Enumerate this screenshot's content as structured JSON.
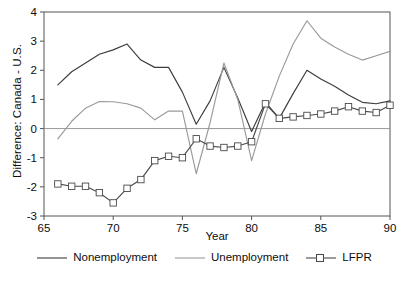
{
  "chart_data": {
    "type": "line",
    "title": "",
    "xlabel": "Year",
    "ylabel": "Difference: Canada - U.S.",
    "xlim": [
      65,
      90
    ],
    "ylim": [
      -3,
      4
    ],
    "xticks": [
      65,
      70,
      75,
      80,
      85,
      90
    ],
    "yticks": [
      -3,
      -2,
      -1,
      0,
      1,
      2,
      3,
      4
    ],
    "grid": false,
    "zero_line": true,
    "legend_position": "below",
    "colors": {
      "nonemployment": "#3c3c3c",
      "unemployment": "#9a9a9a",
      "lfpr": "#4a4a4a",
      "axis": "#555555",
      "zero_line": "#9a9a9a"
    },
    "series": [
      {
        "name": "Nonemployment",
        "marker": "none",
        "x": [
          66,
          67,
          68,
          69,
          70,
          71,
          72,
          73,
          74,
          75,
          76,
          77,
          78,
          79,
          80,
          81,
          82,
          83,
          84,
          85,
          86,
          87,
          88,
          89,
          90
        ],
        "values": [
          1.5,
          1.95,
          2.25,
          2.55,
          2.7,
          2.9,
          2.35,
          2.1,
          2.1,
          1.25,
          0.15,
          0.95,
          2.1,
          1.05,
          -0.1,
          0.9,
          0.35,
          1.2,
          2.0,
          1.7,
          1.45,
          1.15,
          0.9,
          0.85,
          0.95
        ]
      },
      {
        "name": "Unemployment",
        "marker": "none",
        "x": [
          66,
          67,
          68,
          69,
          70,
          71,
          72,
          73,
          74,
          75,
          76,
          77,
          78,
          79,
          80,
          81,
          82,
          83,
          84,
          85,
          86,
          87,
          88,
          89,
          90
        ],
        "values": [
          -0.35,
          0.25,
          0.7,
          0.93,
          0.92,
          0.85,
          0.7,
          0.3,
          0.6,
          0.6,
          -1.55,
          0.2,
          2.25,
          1.0,
          -1.1,
          0.5,
          1.8,
          2.9,
          3.7,
          3.1,
          2.8,
          2.55,
          2.35,
          2.5,
          2.65
        ]
      },
      {
        "name": "LFPR",
        "marker": "square",
        "x": [
          66,
          67,
          68,
          69,
          70,
          71,
          72,
          73,
          74,
          75,
          76,
          77,
          78,
          79,
          80,
          81,
          82,
          83,
          84,
          85,
          86,
          87,
          88,
          89,
          90
        ],
        "values": [
          -1.9,
          -1.98,
          -1.98,
          -2.2,
          -2.55,
          -2.05,
          -1.75,
          -1.1,
          -0.95,
          -1.0,
          -0.35,
          -0.6,
          -0.65,
          -0.6,
          -0.45,
          0.85,
          0.35,
          0.4,
          0.45,
          0.5,
          0.6,
          0.75,
          0.6,
          0.55,
          0.8
        ]
      }
    ]
  },
  "legend": {
    "items": [
      {
        "label": "Nonemployment",
        "swatch": "line-plain"
      },
      {
        "label": "Unemployment",
        "swatch": "line-plain"
      },
      {
        "label": "LFPR",
        "swatch": "line-square"
      }
    ]
  }
}
